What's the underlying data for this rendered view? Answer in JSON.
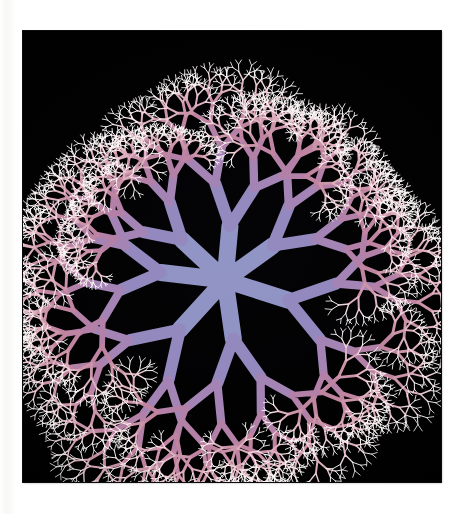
{
  "page": {
    "background_color": "#fefefd",
    "width": 461,
    "height": 514,
    "caption_text": ""
  },
  "plate": {
    "background_color": "#000000",
    "left": 23,
    "top": 31,
    "width": 418,
    "height": 451,
    "title": "Radial dichotomous branching fractal"
  },
  "figure": {
    "name": "branching-fractal",
    "center_x": 202,
    "center_y": 249,
    "primary_branch_count": 7,
    "recursion_depth": 9,
    "branch_angle_deg": 30,
    "length_ratio": 0.74,
    "width_ratio": 0.7,
    "trunk_length": 62,
    "trunk_width": 17,
    "radial_extent": 196,
    "jitter_angle_deg": 7,
    "jitter_length": 0.14,
    "random_seed": 20349
  },
  "chart_data": {
    "type": "scatter",
    "title": "Radial dichotomous branching fractal",
    "xlabel": "",
    "ylabel": "",
    "series": [
      {
        "name": "trunk-level",
        "depth": 0,
        "color": "#8f93c4",
        "branch_width": 17,
        "branch_length": 62,
        "segment_count": 7
      },
      {
        "name": "level-1",
        "depth": 1,
        "color": "#9288bd",
        "branch_width": 11.9,
        "branch_length": 45.9,
        "segment_count": 14
      },
      {
        "name": "level-2",
        "depth": 2,
        "color": "#a383b4",
        "branch_width": 8.3,
        "branch_length": 34.0,
        "segment_count": 28
      },
      {
        "name": "level-3",
        "depth": 3,
        "color": "#b27fa6",
        "branch_width": 5.8,
        "branch_length": 25.1,
        "segment_count": 56
      },
      {
        "name": "level-4",
        "depth": 4,
        "color": "#be839f",
        "branch_width": 4.1,
        "branch_length": 18.6,
        "segment_count": 112
      },
      {
        "name": "level-5",
        "depth": 5,
        "color": "#cb93a8",
        "branch_width": 2.9,
        "branch_length": 13.8,
        "segment_count": 224
      },
      {
        "name": "level-6",
        "depth": 6,
        "color": "#dcaebc",
        "branch_width": 2.0,
        "branch_length": 10.2,
        "segment_count": 448
      },
      {
        "name": "level-7",
        "depth": 7,
        "color": "#eed2d8",
        "branch_width": 1.4,
        "branch_length": 7.5,
        "segment_count": 896
      },
      {
        "name": "level-8",
        "depth": 8,
        "color": "#fdf8f8",
        "branch_width": 1.0,
        "branch_length": 5.6,
        "segment_count": 1792
      }
    ],
    "colormap_stops": [
      "#8f93c4",
      "#9288bd",
      "#a383b4",
      "#b27fa6",
      "#be839f",
      "#cb93a8",
      "#dcaebc",
      "#eed2d8",
      "#fdf8f8"
    ],
    "background": "#000000",
    "grid": false,
    "legend_position": "none"
  },
  "colors": {
    "page_white": "#fefefd",
    "plate_black": "#000000",
    "trunk_periwinkle": "#8f93c4",
    "mid_mauve": "#b27fa6",
    "outer_pink": "#dcaebc",
    "tip_white": "#fdf8f8"
  }
}
